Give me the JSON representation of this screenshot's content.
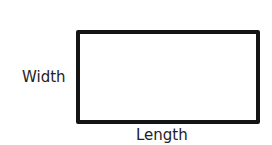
{
  "diagram": {
    "shape": "rectangle",
    "labels": {
      "width": "Width",
      "length": "Length"
    },
    "colors": {
      "stroke": "#141414",
      "fill": "#ffffff",
      "text": "#222222"
    }
  }
}
